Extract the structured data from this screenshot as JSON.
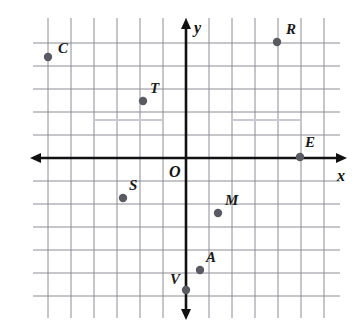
{
  "figure": {
    "kind": "coordinate-plane",
    "title": "",
    "origin_label": "O",
    "x_axis_label": "x",
    "y_axis_label": "y",
    "background_color": "#ffffff",
    "grid_color": "#8c8c96",
    "grid_color_faint": "#c9c9d2",
    "axis_color": "#111111",
    "point_color": "#5a5a62",
    "label_color": "#1a1a1a"
  },
  "chart_data": {
    "type": "scatter",
    "title": "",
    "xlabel": "x",
    "ylabel": "y",
    "grid": true,
    "legend": false,
    "xlim": [
      -6.5,
      6.2
    ],
    "ylim": [
      -6.5,
      5.2
    ],
    "unit_px": 23,
    "origin_px": {
      "x": 186,
      "y": 158
    },
    "grid_bounds_px": {
      "left": 47,
      "right": 324,
      "top": 42,
      "bottom": 312
    },
    "axis_extent_px": {
      "x_start": 30,
      "x_end": 347,
      "y_start": 18,
      "y_end": 320
    },
    "points": [
      {
        "name": "C",
        "x": -6,
        "y": 4.4,
        "px": 48,
        "py": 57,
        "label_dx": 10,
        "label_dy": -16
      },
      {
        "name": "R",
        "x": 4,
        "y": 5,
        "px": 277,
        "py": 42,
        "label_dx": 9,
        "label_dy": -20
      },
      {
        "name": "T",
        "x": -1.9,
        "y": 2.5,
        "px": 143,
        "py": 101,
        "label_dx": 7,
        "label_dy": -20
      },
      {
        "name": "E",
        "x": 5,
        "y": 0,
        "px": 300,
        "py": 157,
        "label_dx": 5,
        "label_dy": -22
      },
      {
        "name": "S",
        "x": -2.7,
        "y": -1.7,
        "px": 123,
        "py": 198,
        "label_dx": 6,
        "label_dy": -20
      },
      {
        "name": "M",
        "x": 1.4,
        "y": -2.4,
        "px": 218,
        "py": 213,
        "label_dx": 7,
        "label_dy": -20
      },
      {
        "name": "A",
        "x": 0.6,
        "y": -4.9,
        "px": 200,
        "py": 270,
        "label_dx": 6,
        "label_dy": -20
      },
      {
        "name": "V",
        "x": 0,
        "y": -5.7,
        "px": 186,
        "py": 290,
        "label_dx": -16,
        "label_dy": -18
      }
    ],
    "faint_segments": [
      {
        "x1": 93,
        "y1": 120,
        "x2": 162,
        "y2": 120
      },
      {
        "x1": 232,
        "y1": 120,
        "x2": 300,
        "y2": 120
      }
    ]
  }
}
